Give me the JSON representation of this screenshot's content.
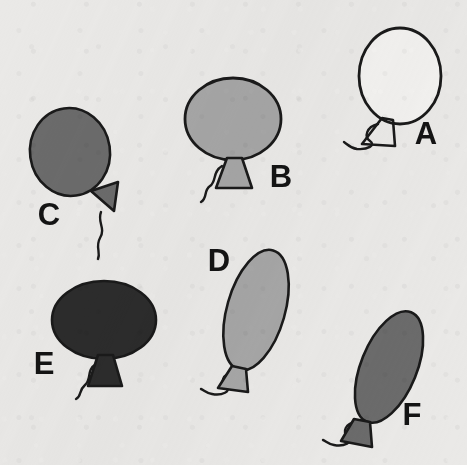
{
  "scene": {
    "title": "Balloons line drawing",
    "description": "Six cartoon balloons with knots and curly strings, each labeled with a letter",
    "width": 467,
    "height": 465,
    "background_color": "#eae9e7",
    "outline_color": "#1a1a1a",
    "label_color": "#141414"
  },
  "palette": {
    "white": "#f2f1ef",
    "light_gray": "#a6a6a6",
    "medium_gray": "#6b6b6b",
    "dark_gray": "#2c2c2c"
  },
  "balloons": [
    {
      "id": "a",
      "label": "A",
      "fill_name": "white",
      "fill": "#f2f1ef",
      "shape": "circle",
      "size": "large",
      "orientation": "upright",
      "center": {
        "x": 400,
        "y": 76
      },
      "radius": {
        "rx": 41,
        "ry": 48
      },
      "rotation": 0,
      "knot": {
        "x": 385,
        "y": 123,
        "rotation": -8,
        "filled": false
      },
      "string": "wavy-left",
      "label_pos": {
        "x": 426,
        "y": 144
      }
    },
    {
      "id": "b",
      "label": "B",
      "fill_name": "light_gray",
      "fill": "#a6a6a6",
      "shape": "oval-wide",
      "size": "large",
      "orientation": "upright",
      "center": {
        "x": 233,
        "y": 119
      },
      "radius": {
        "rx": 48,
        "ry": 41
      },
      "rotation": 0,
      "knot": {
        "x": 234,
        "y": 166,
        "rotation": 0,
        "filled": true
      },
      "string": "wavy-left",
      "label_pos": {
        "x": 281,
        "y": 187
      }
    },
    {
      "id": "c",
      "label": "C",
      "fill_name": "medium_gray",
      "fill": "#6b6b6b",
      "shape": "oval-round",
      "size": "medium",
      "orientation": "upright",
      "center": {
        "x": 70,
        "y": 152
      },
      "radius": {
        "rx": 40,
        "ry": 44
      },
      "rotation": -8,
      "knot": {
        "x": 99,
        "y": 200,
        "rotation": 58,
        "filled": true
      },
      "string": "wavy-down",
      "label_pos": {
        "x": 49,
        "y": 225
      }
    },
    {
      "id": "d",
      "label": "D",
      "fill_name": "light_gray",
      "fill": "#a6a6a6",
      "shape": "oval-tall",
      "size": "large",
      "orientation": "tilted-right",
      "center": {
        "x": 256,
        "y": 310
      },
      "radius": {
        "rx": 29,
        "ry": 62
      },
      "rotation": 16,
      "knot": {
        "x": 238,
        "y": 372,
        "rotation": -12,
        "filled": true
      },
      "string": "wavy-left",
      "label_pos": {
        "x": 219,
        "y": 271
      }
    },
    {
      "id": "e",
      "label": "E",
      "fill_name": "dark_gray",
      "fill": "#2c2c2c",
      "shape": "oval-wide",
      "size": "large",
      "orientation": "upright",
      "center": {
        "x": 104,
        "y": 320
      },
      "radius": {
        "rx": 52,
        "ry": 39
      },
      "rotation": 0,
      "knot": {
        "x": 106,
        "y": 367,
        "rotation": 0,
        "filled": true
      },
      "string": "wavy-left",
      "label_pos": {
        "x": 44,
        "y": 374
      }
    },
    {
      "id": "f",
      "label": "F",
      "fill_name": "medium_gray",
      "fill": "#6b6b6b",
      "shape": "oval-tall",
      "size": "large",
      "orientation": "tilted-right",
      "center": {
        "x": 389,
        "y": 367
      },
      "radius": {
        "rx": 28,
        "ry": 59
      },
      "rotation": 22,
      "knot": {
        "x": 361,
        "y": 425,
        "rotation": -18,
        "filled": true
      },
      "string": "wavy-left",
      "label_pos": {
        "x": 412,
        "y": 425
      }
    }
  ]
}
